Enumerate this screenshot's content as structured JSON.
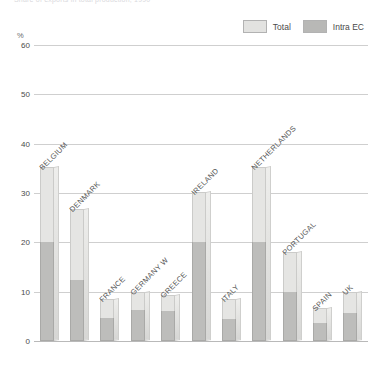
{
  "caption": "Share of exports in total production, 1990",
  "legend": {
    "position": "top-right",
    "entries": [
      {
        "label": "Total",
        "color": "#e5e5e3",
        "name": "total"
      },
      {
        "label": "Intra EC",
        "color": "#bdbdbb",
        "name": "intra-ec"
      }
    ]
  },
  "axis": {
    "unit": "%",
    "ticks": [
      0,
      10,
      20,
      30,
      40,
      50,
      60
    ]
  },
  "chart_data": {
    "type": "bar",
    "title": "Share of exports in total production, 1990",
    "xlabel": "",
    "ylabel": "%",
    "ylim": [
      0,
      60
    ],
    "grid": true,
    "legend_position": "top-right",
    "stacked": true,
    "categories": [
      "BELGIUM",
      "DENMARK",
      "FRANCE",
      "GERMANY W",
      "GREECE",
      "IRELAND",
      "ITALY",
      "NETHERLANDS",
      "PORTUGAL",
      "SPAIN",
      "UK"
    ],
    "series": [
      {
        "name": "Total",
        "color": "#e5e5e3",
        "values": [
          35.3,
          26.7,
          8.6,
          10.0,
          9.4,
          30.2,
          8.6,
          35.3,
          18.0,
          6.7,
          10.0
        ]
      },
      {
        "name": "Intra EC",
        "color": "#bdbdbb",
        "values": [
          20.0,
          12.4,
          4.7,
          6.3,
          6.1,
          20.0,
          4.5,
          20.0,
          10.0,
          3.7,
          5.7
        ]
      }
    ]
  }
}
